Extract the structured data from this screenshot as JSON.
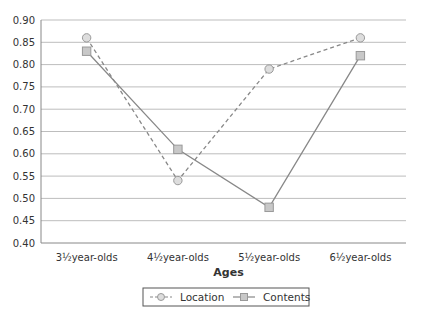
{
  "chart_data": {
    "type": "line",
    "title": "",
    "xlabel": "Ages",
    "ylabel": "",
    "categories": [
      "3½year-olds",
      "4½year-olds",
      "5½year-olds",
      "6½year-olds"
    ],
    "ylim": [
      0.4,
      0.9
    ],
    "yticks": [
      "0.90",
      "0.85",
      "0.80",
      "0.75",
      "0.70",
      "0.65",
      "0.60",
      "0.55",
      "0.50",
      "0.45",
      "0.40"
    ],
    "ytick_values": [
      0.9,
      0.85,
      0.8,
      0.75,
      0.7,
      0.65,
      0.6,
      0.55,
      0.5,
      0.45,
      0.4
    ],
    "grid": true,
    "legend_position": "bottom-center",
    "series": [
      {
        "name": "Location",
        "values": [
          0.86,
          0.54,
          0.79,
          0.86
        ],
        "line_style": "dashed",
        "marker": "circle",
        "color": "#888888",
        "marker_fill": "#dddddd"
      },
      {
        "name": "Contents",
        "values": [
          0.83,
          0.61,
          0.48,
          0.82
        ],
        "line_style": "solid",
        "marker": "square",
        "color": "#888888",
        "marker_fill": "#c8c8c8"
      }
    ]
  }
}
